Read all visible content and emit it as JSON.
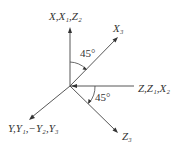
{
  "diagram": {
    "type": "coordinate-axes",
    "colors": {
      "stroke": "#444444",
      "text": "#333333",
      "background": "#ffffff"
    },
    "axes": [
      {
        "id": "vertical",
        "label": "X,X₁,Z₂",
        "direction": "up"
      },
      {
        "id": "x3",
        "label": "X₃",
        "direction": "up-right 45°"
      },
      {
        "id": "horizontal",
        "label": "Z,Z₁,X₂",
        "direction": "right"
      },
      {
        "id": "z3",
        "label": "Z₃",
        "direction": "down-right 45°"
      },
      {
        "id": "y",
        "label": "Y,Y₁,−Y₂,Y₃",
        "direction": "down-left"
      }
    ],
    "angles": [
      {
        "id": "angle-vertical-x3",
        "label": "45°"
      },
      {
        "id": "angle-horizontal-z3",
        "label": "45°"
      }
    ]
  }
}
